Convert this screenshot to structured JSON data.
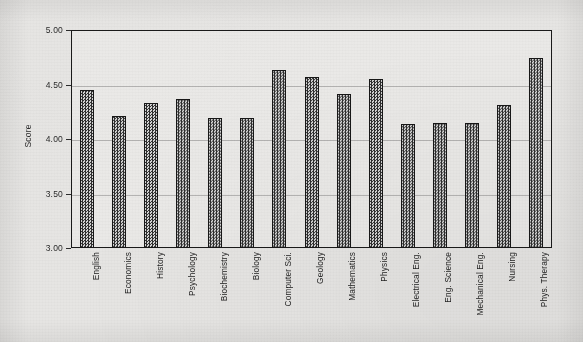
{
  "chart_data": {
    "type": "bar",
    "title": "",
    "xlabel": "",
    "ylabel": "Score",
    "ylim": [
      3.0,
      5.0
    ],
    "ytick_step": 0.5,
    "ytick_labels": [
      "5.00",
      "4.50",
      "4.00",
      "3.50",
      "3.00"
    ],
    "ytick_values": [
      5.0,
      4.5,
      4.0,
      3.5,
      3.0
    ],
    "grid": true,
    "legend": "none",
    "bar_fill": "checkered-hatch",
    "bar_edge_color": "#171717",
    "background_color": "#e6e5e3",
    "categories": [
      "English",
      "Economics",
      "History",
      "Psychology",
      "Biochemistry",
      "Biology",
      "Computer Sci.",
      "Geology",
      "Mathematics",
      "Physics",
      "Electrical Eng.",
      "Eng. Science",
      "Mechanical Eng.",
      "Nursing",
      "Phys. Therapy"
    ],
    "values": [
      4.45,
      4.21,
      4.33,
      4.37,
      4.19,
      4.19,
      4.63,
      4.57,
      4.41,
      4.55,
      4.14,
      4.15,
      4.15,
      4.31,
      4.74
    ]
  }
}
